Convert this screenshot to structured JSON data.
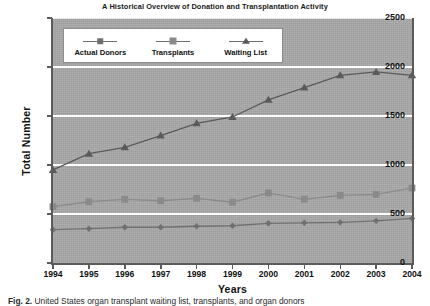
{
  "chart_data": {
    "type": "line",
    "title": "A Historical Overview of Donation and Transplantation Activity",
    "xlabel": "Years",
    "ylabel": "Total Number",
    "categories": [
      "1994",
      "1995",
      "1996",
      "1997",
      "1998",
      "1999",
      "2000",
      "2001",
      "2002",
      "2003",
      "2004"
    ],
    "x": [
      1994,
      1995,
      1996,
      1997,
      1998,
      1999,
      2000,
      2001,
      2002,
      2003,
      2004
    ],
    "ylim": [
      0,
      2500
    ],
    "yticks": [
      0,
      500,
      1000,
      1500,
      2000,
      2500
    ],
    "grid": "horizontal-white",
    "legend_position": "upper-left-inside",
    "plot_background": "#a9a9a9",
    "series": [
      {
        "name": "Actual Donors",
        "marker": "diamond",
        "color": "#707070",
        "values": [
          340,
          350,
          365,
          365,
          375,
          380,
          405,
          410,
          415,
          430,
          455
        ]
      },
      {
        "name": "Transplants",
        "marker": "square",
        "color": "#8a8a8a",
        "values": [
          575,
          625,
          650,
          635,
          660,
          620,
          715,
          650,
          690,
          700,
          765
        ]
      },
      {
        "name": "Waiting List",
        "marker": "triangle",
        "color": "#5a5a5a",
        "values": [
          950,
          1115,
          1180,
          1300,
          1425,
          1490,
          1665,
          1790,
          1915,
          1950,
          1915
        ]
      }
    ]
  },
  "legend": {
    "items": [
      {
        "label": "Actual Donors",
        "marker": "diamond"
      },
      {
        "label": "Transplants",
        "marker": "square"
      },
      {
        "label": "Waiting List",
        "marker": "triangle"
      }
    ]
  },
  "caption": {
    "figure_number": "Fig. 2.",
    "text": "United States organ transplant waiting list, transplants, and organ donors"
  }
}
